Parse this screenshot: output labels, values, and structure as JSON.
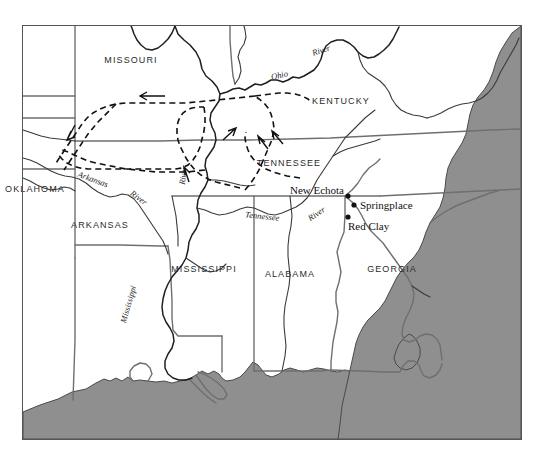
{
  "map": {
    "title": "Trail of Tears routes, southeastern United States",
    "frame": {
      "x": 22,
      "y": 25,
      "width": 500,
      "height": 415
    },
    "colors": {
      "water": "#8f8f8f",
      "land": "#ffffff",
      "state_border": "#6f6f6f",
      "river": "#1f1f1f",
      "trail": "#111111",
      "frame": "#555555",
      "label_text": "#2b2b2b"
    },
    "states": [
      {
        "name": "MISSOURI",
        "x": 131,
        "y": 63
      },
      {
        "name": "KENTUCKY",
        "x": 341,
        "y": 104
      },
      {
        "name": "TENNESSEE",
        "x": 289,
        "y": 166
      },
      {
        "name": "OKLAHOMA",
        "x": 35,
        "y": 192
      },
      {
        "name": "ARKANSAS",
        "x": 100,
        "y": 228
      },
      {
        "name": "MISSISSIPPI",
        "x": 204,
        "y": 272
      },
      {
        "name": "ALABAMA",
        "x": 290,
        "y": 277
      },
      {
        "name": "GEORGIA",
        "x": 392,
        "y": 272
      }
    ],
    "cities": [
      {
        "name": "New Echota",
        "label_x": 296,
        "label_y": 194,
        "dot_x": 348,
        "dot_y": 196,
        "label_anchor": "end"
      },
      {
        "name": "Springplace",
        "label_x": 360,
        "label_y": 208,
        "dot_x": 354,
        "dot_y": 205,
        "label_anchor": "start"
      },
      {
        "name": "Red Clay",
        "label_x": 348,
        "label_y": 229,
        "dot_x": 348,
        "dot_y": 217,
        "label_anchor": "start"
      }
    ],
    "rivers": [
      {
        "name": "Ohio",
        "x": 280,
        "y": 78,
        "rotate": -12
      },
      {
        "name": "River",
        "x": 322,
        "y": 53,
        "rotate": -18
      },
      {
        "name": "River",
        "x": 186,
        "y": 176,
        "rotate": -82
      },
      {
        "name": "Arkansas",
        "x": 92,
        "y": 182,
        "rotate": 20
      },
      {
        "name": "River",
        "x": 137,
        "y": 200,
        "rotate": 36
      },
      {
        "name": "Mississippi",
        "x": 131,
        "y": 305,
        "rotate": -74
      },
      {
        "name": "Tennessee",
        "x": 262,
        "y": 219,
        "rotate": 6
      },
      {
        "name": "River",
        "x": 318,
        "y": 216,
        "rotate": -34
      }
    ],
    "legend": {
      "trail_description": "dashed lines with westward arrows indicate removal routes"
    }
  }
}
